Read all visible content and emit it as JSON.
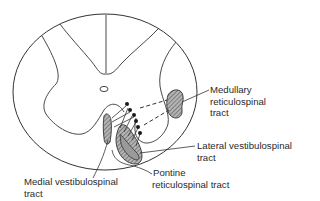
{
  "figure": {
    "colors": {
      "line": "#333333",
      "tract_fill": "#8a8a8a",
      "background": "#ffffff"
    }
  },
  "labels": {
    "medullary": {
      "line1": "Medullary",
      "line2": "reticulospinal",
      "line3": "tract"
    },
    "lateral": {
      "line1": "Lateral vestibulospinal",
      "line2": "tract"
    },
    "medial": {
      "line1": "Medial vestibulospinal",
      "line2": "tract"
    },
    "pontine": {
      "line1": "Pontine",
      "line2": "reticulospinal tract"
    }
  }
}
